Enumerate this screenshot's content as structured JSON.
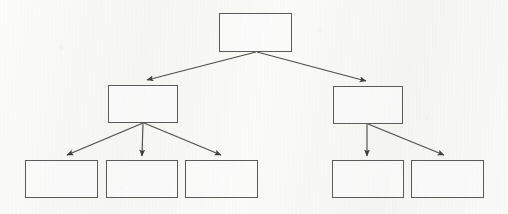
{
  "diagram": {
    "type": "tree-hierarchy",
    "title": "",
    "orientation": "top-down",
    "canvas": {
      "width": 508,
      "height": 214
    },
    "style": {
      "background_color": "#f7f7f6",
      "box_border_color": "#5b5b5b",
      "box_fill_color": "#fcfcfb",
      "connector_color": "#4e4e4e",
      "arrowhead": "solid-triangle"
    },
    "nodes": [
      {
        "id": "root",
        "label": "",
        "level": 0,
        "x": 219,
        "y": 13,
        "w": 73,
        "h": 39
      },
      {
        "id": "mid-1",
        "label": "",
        "level": 1,
        "x": 108,
        "y": 85,
        "w": 70,
        "h": 38
      },
      {
        "id": "mid-2",
        "label": "",
        "level": 1,
        "x": 333,
        "y": 86,
        "w": 70,
        "h": 38
      },
      {
        "id": "leaf-1",
        "label": "",
        "level": 2,
        "x": 25,
        "y": 160,
        "w": 73,
        "h": 38
      },
      {
        "id": "leaf-2",
        "label": "",
        "level": 2,
        "x": 106,
        "y": 160,
        "w": 72,
        "h": 38
      },
      {
        "id": "leaf-3",
        "label": "",
        "level": 2,
        "x": 185,
        "y": 160,
        "w": 73,
        "h": 38
      },
      {
        "id": "leaf-4",
        "label": "",
        "level": 2,
        "x": 332,
        "y": 160,
        "w": 72,
        "h": 38
      },
      {
        "id": "leaf-5",
        "label": "",
        "level": 2,
        "x": 411,
        "y": 160,
        "w": 73,
        "h": 38
      }
    ],
    "edges": [
      {
        "id": "e1",
        "from": "root",
        "to": "mid-1",
        "x1": 256,
        "y1": 52,
        "x2": 147,
        "y2": 80
      },
      {
        "id": "e2",
        "from": "root",
        "to": "mid-2",
        "x1": 257,
        "y1": 52,
        "x2": 366,
        "y2": 81
      },
      {
        "id": "e3",
        "from": "mid-1",
        "to": "leaf-1",
        "x1": 143,
        "y1": 123,
        "x2": 67,
        "y2": 155
      },
      {
        "id": "e4",
        "from": "mid-1",
        "to": "leaf-2",
        "x1": 143,
        "y1": 123,
        "x2": 142,
        "y2": 156
      },
      {
        "id": "e5",
        "from": "mid-1",
        "to": "leaf-3",
        "x1": 144,
        "y1": 123,
        "x2": 221,
        "y2": 155
      },
      {
        "id": "e6",
        "from": "mid-2",
        "to": "leaf-4",
        "x1": 367,
        "y1": 124,
        "x2": 367,
        "y2": 156
      },
      {
        "id": "e7",
        "from": "mid-2",
        "to": "leaf-5",
        "x1": 368,
        "y1": 124,
        "x2": 444,
        "y2": 155
      }
    ]
  }
}
